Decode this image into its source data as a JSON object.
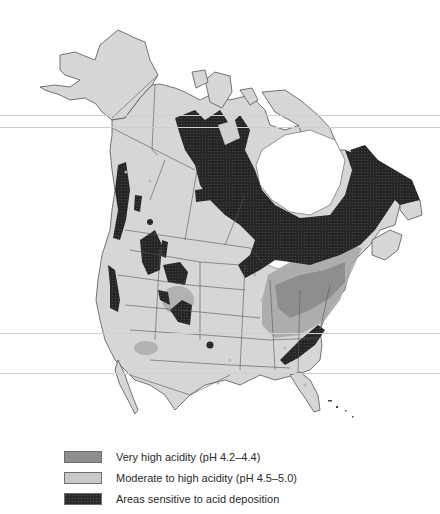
{
  "map": {
    "subject": "Acid precipitation and sensitive areas in North America",
    "colors": {
      "land": "#d6d6d6",
      "border": "#555555",
      "very_high_acidity": "#8e8e8e",
      "moderate_high_acidity": "#c9c9c9",
      "sensitive": "#2a2a2a",
      "water": "#ffffff"
    }
  },
  "legend": {
    "items": [
      {
        "label": "Very high acidity (pH 4.2–4.4)",
        "swatch": "very-high-acidity"
      },
      {
        "label": "Moderate to high acidity (pH 4.5–5.0)",
        "swatch": "moderate-high-acidity"
      },
      {
        "label": "Areas sensitive to acid deposition",
        "swatch": "sensitive-areas"
      }
    ]
  }
}
